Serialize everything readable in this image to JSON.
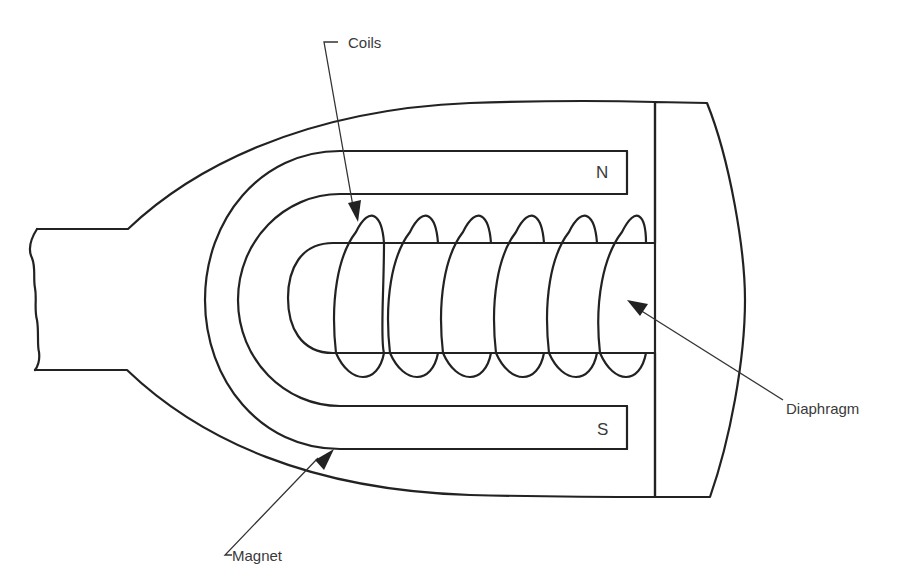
{
  "diagram": {
    "labels": {
      "coils": "Coils",
      "diaphragm": "Diaphragm",
      "magnet": "Magnet",
      "north_pole": "N",
      "south_pole": "S"
    },
    "colors": {
      "line": "#222222",
      "text": "#3a3a3a",
      "background": "#ffffff"
    },
    "coil_turns": 6
  }
}
